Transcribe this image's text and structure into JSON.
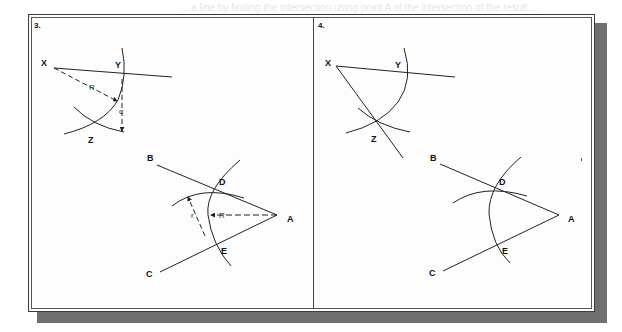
{
  "background_text": "... a line by finding the intersection using point A of the intersection of the result ...",
  "panels": [
    {
      "number": "3.",
      "labels": {
        "x": "X",
        "y": "Y",
        "z": "Z",
        "b": "B",
        "c": "C",
        "d": "D",
        "e": "E",
        "a": "A",
        "radius_big_1": "R",
        "radius_small_1": "c",
        "radius_big_2": "R",
        "radius_small_2": "r"
      }
    },
    {
      "number": "4.",
      "labels": {
        "x": "X",
        "y": "Y",
        "z": "Z",
        "b": "B",
        "c": "C",
        "d": "D",
        "e": "E",
        "a": "A"
      }
    }
  ],
  "colors": {
    "line": "#222222",
    "frame": "#3a3a3a",
    "shadow": "#6f6f6f"
  }
}
